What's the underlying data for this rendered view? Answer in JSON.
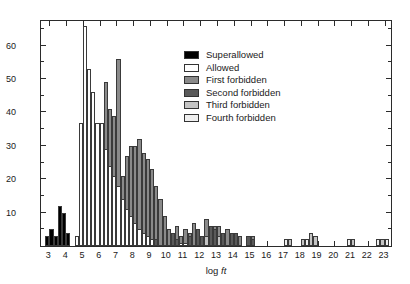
{
  "chart_data": {
    "type": "bar",
    "title": "",
    "xlabel": "log ft",
    "ylabel": "Number of cases",
    "xlim": [
      2.5,
      23.5
    ],
    "ylim": [
      0,
      68
    ],
    "grid": false,
    "bin_width": 0.25,
    "legend_position": "top-right",
    "yticks_major": [
      10,
      20,
      30,
      40,
      50,
      60
    ],
    "yticks_minor": [
      5,
      15,
      25,
      35,
      45,
      55,
      65
    ],
    "xticks": [
      3,
      4,
      5,
      6,
      7,
      8,
      9,
      10,
      11,
      12,
      13,
      14,
      15,
      16,
      17,
      18,
      19,
      20,
      21,
      22,
      23
    ],
    "series": [
      {
        "name": "Superallowed",
        "color": "#000000",
        "bins": [
          {
            "x": 2.75,
            "value": 3
          },
          {
            "x": 3.0,
            "value": 5
          },
          {
            "x": 3.25,
            "value": 3
          },
          {
            "x": 3.5,
            "value": 12
          },
          {
            "x": 3.75,
            "value": 10
          },
          {
            "x": 4.0,
            "value": 4
          },
          {
            "x": 9.0,
            "value": 1
          }
        ]
      },
      {
        "name": "Allowed",
        "color": "#ffffff",
        "bins": [
          {
            "x": 4.5,
            "value": 3
          },
          {
            "x": 4.75,
            "value": 37
          },
          {
            "x": 5.0,
            "value": 66
          },
          {
            "x": 5.25,
            "value": 53
          },
          {
            "x": 5.5,
            "value": 46
          },
          {
            "x": 5.75,
            "value": 37
          },
          {
            "x": 6.0,
            "value": 37
          },
          {
            "x": 6.25,
            "value": 29
          },
          {
            "x": 6.5,
            "value": 24
          },
          {
            "x": 6.75,
            "value": 21
          },
          {
            "x": 7.0,
            "value": 18
          },
          {
            "x": 7.25,
            "value": 14
          },
          {
            "x": 7.5,
            "value": 11
          },
          {
            "x": 7.75,
            "value": 9
          },
          {
            "x": 8.0,
            "value": 7
          },
          {
            "x": 8.25,
            "value": 5
          },
          {
            "x": 8.5,
            "value": 4
          },
          {
            "x": 8.75,
            "value": 3
          },
          {
            "x": 9.0,
            "value": 2
          },
          {
            "x": 10.75,
            "value": 1
          },
          {
            "x": 11.0,
            "value": 1
          }
        ]
      },
      {
        "name": "First forbidden",
        "color": "#8a8a8a",
        "bins": [
          {
            "x": 5.0,
            "value": 66
          },
          {
            "x": 5.25,
            "value": 53
          },
          {
            "x": 5.5,
            "value": 46
          },
          {
            "x": 6.0,
            "value": 37
          },
          {
            "x": 6.25,
            "value": 49
          },
          {
            "x": 6.5,
            "value": 41
          },
          {
            "x": 6.75,
            "value": 39
          },
          {
            "x": 7.0,
            "value": 56
          },
          {
            "x": 7.25,
            "value": 21
          },
          {
            "x": 7.5,
            "value": 27
          },
          {
            "x": 7.75,
            "value": 30
          },
          {
            "x": 8.0,
            "value": 30
          },
          {
            "x": 8.25,
            "value": 32
          },
          {
            "x": 8.5,
            "value": 28
          },
          {
            "x": 8.75,
            "value": 26
          },
          {
            "x": 9.0,
            "value": 23
          },
          {
            "x": 9.25,
            "value": 18
          },
          {
            "x": 9.5,
            "value": 14
          },
          {
            "x": 9.75,
            "value": 9
          },
          {
            "x": 10.0,
            "value": 5
          },
          {
            "x": 10.25,
            "value": 4
          },
          {
            "x": 10.5,
            "value": 6
          },
          {
            "x": 10.75,
            "value": 3
          },
          {
            "x": 11.0,
            "value": 5
          },
          {
            "x": 11.25,
            "value": 4
          },
          {
            "x": 11.5,
            "value": 7
          },
          {
            "x": 11.75,
            "value": 4
          },
          {
            "x": 12.0,
            "value": 3
          },
          {
            "x": 12.25,
            "value": 8
          },
          {
            "x": 12.5,
            "value": 5
          },
          {
            "x": 12.75,
            "value": 6
          },
          {
            "x": 13.0,
            "value": 6
          },
          {
            "x": 13.25,
            "value": 4
          },
          {
            "x": 13.5,
            "value": 5
          },
          {
            "x": 13.75,
            "value": 2
          },
          {
            "x": 14.0,
            "value": 4
          },
          {
            "x": 14.25,
            "value": 3
          },
          {
            "x": 15.0,
            "value": 3
          }
        ]
      },
      {
        "name": "Second forbidden",
        "color": "#5a5a5a",
        "bins": [
          {
            "x": 6.5,
            "value": 4
          },
          {
            "x": 7.0,
            "value": 2
          },
          {
            "x": 9.25,
            "value": 2
          },
          {
            "x": 10.25,
            "value": 4
          },
          {
            "x": 10.5,
            "value": 2
          },
          {
            "x": 11.25,
            "value": 3
          },
          {
            "x": 11.75,
            "value": 5
          },
          {
            "x": 12.0,
            "value": 3
          },
          {
            "x": 12.5,
            "value": 6
          },
          {
            "x": 12.75,
            "value": 5
          },
          {
            "x": 13.25,
            "value": 4
          },
          {
            "x": 13.75,
            "value": 4
          },
          {
            "x": 14.0,
            "value": 4
          },
          {
            "x": 14.75,
            "value": 3
          },
          {
            "x": 15.0,
            "value": 2
          }
        ]
      },
      {
        "name": "Third forbidden",
        "color": "#c4c4c4",
        "bins": [
          {
            "x": 12.25,
            "value": 3
          },
          {
            "x": 13.0,
            "value": 3
          },
          {
            "x": 17.25,
            "value": 2
          },
          {
            "x": 18.0,
            "value": 2
          },
          {
            "x": 18.5,
            "value": 4
          },
          {
            "x": 18.75,
            "value": 3
          },
          {
            "x": 21.0,
            "value": 2
          },
          {
            "x": 22.75,
            "value": 2
          }
        ]
      },
      {
        "name": "Fourth forbidden",
        "color": "#efefef",
        "bins": [
          {
            "x": 17.0,
            "value": 2
          },
          {
            "x": 18.25,
            "value": 2
          },
          {
            "x": 20.75,
            "value": 2
          },
          {
            "x": 22.5,
            "value": 2
          },
          {
            "x": 23.0,
            "value": 2
          }
        ]
      }
    ]
  },
  "legend": {
    "items": [
      {
        "label": "Superallowed",
        "color": "#000000"
      },
      {
        "label": "Allowed",
        "color": "#ffffff"
      },
      {
        "label": "First forbidden",
        "color": "#8a8a8a"
      },
      {
        "label": "Second forbidden",
        "color": "#5a5a5a"
      },
      {
        "label": "Third forbidden",
        "color": "#c4c4c4"
      },
      {
        "label": "Fourth forbidden",
        "color": "#efefef"
      }
    ]
  },
  "axes": {
    "y_title": "Number of cases",
    "x_title_main": "log ",
    "x_title_italic": "ft"
  }
}
